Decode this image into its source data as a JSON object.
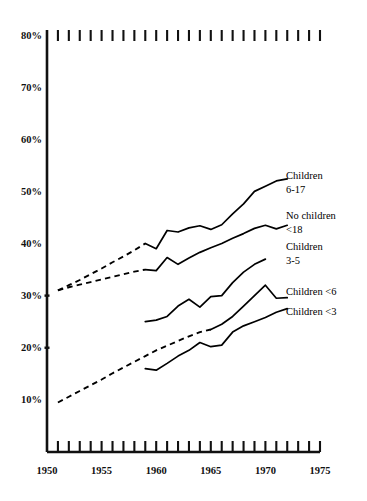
{
  "chart_data": {
    "type": "line",
    "title": "",
    "subtitle": "",
    "xlabel": "",
    "ylabel": "",
    "xlim": [
      1950,
      1975
    ],
    "ylim": [
      0,
      80
    ],
    "x_tick_labels": [
      "1950",
      "1955",
      "1960",
      "1965",
      "1970",
      "1975"
    ],
    "x_tick_values": [
      1950,
      1955,
      1960,
      1965,
      1970,
      1975
    ],
    "x_minor_tick_interval": 1,
    "y_tick_labels": [
      "10%",
      "20%",
      "30%",
      "40%",
      "50%",
      "60%",
      "70%",
      "80%"
    ],
    "y_tick_values": [
      10,
      20,
      30,
      40,
      50,
      60,
      70,
      80
    ],
    "grid": false,
    "legend_position": "right-inline",
    "axis_top_ticks": true,
    "axis_bottom_ticks": true,
    "series": [
      {
        "name": "Children 6-17",
        "label": "Children",
        "label_line2": "6-17",
        "style": "solid-with-dashed-lead",
        "dashed_segment": {
          "x": [
            1951,
            1952,
            1953,
            1954,
            1955,
            1956,
            1957,
            1958,
            1959
          ],
          "values": [
            31.0,
            32.0,
            33.0,
            34.1,
            35.2,
            36.4,
            37.5,
            38.7,
            40.0
          ]
        },
        "x": [
          1959,
          1960,
          1961,
          1962,
          1963,
          1964,
          1965,
          1966,
          1967,
          1968,
          1969,
          1970,
          1971,
          1972
        ],
        "values": [
          40.0,
          39.0,
          42.5,
          42.2,
          43.0,
          43.4,
          42.7,
          43.6,
          45.7,
          47.6,
          50.0,
          51.0,
          52.0,
          52.4
        ]
      },
      {
        "name": "No children <18",
        "label": "No children",
        "label_line2": "<18",
        "style": "solid-with-dashed-lead",
        "dashed_segment": {
          "x": [
            1951,
            1952,
            1953,
            1954,
            1955,
            1956,
            1957,
            1958,
            1959
          ],
          "values": [
            31.0,
            31.6,
            32.1,
            32.6,
            33.1,
            33.6,
            34.1,
            34.6,
            35.0
          ]
        },
        "x": [
          1959,
          1960,
          1961,
          1962,
          1963,
          1964,
          1965,
          1966,
          1967,
          1968,
          1969,
          1970,
          1971,
          1972
        ],
        "values": [
          35.0,
          34.8,
          37.3,
          36.0,
          37.2,
          38.3,
          39.2,
          40.0,
          41.0,
          41.9,
          42.9,
          43.5,
          42.8,
          43.5
        ]
      },
      {
        "name": "Children 3-5",
        "label": "Children",
        "label_line2": "3-5",
        "style": "solid",
        "x": [
          1959,
          1960,
          1961,
          1962,
          1963,
          1964,
          1965,
          1966,
          1967,
          1968,
          1969,
          1970
        ],
        "values": [
          25.0,
          25.3,
          26.0,
          28.0,
          29.3,
          27.8,
          29.8,
          30.0,
          32.5,
          34.5,
          36.0,
          37.0
        ]
      },
      {
        "name": "Children <6",
        "label": "Children <6",
        "label_line2": "",
        "style": "solid-with-dashed-lead",
        "dashed_segment": {
          "x": [
            1951,
            1952,
            1953,
            1954,
            1955,
            1956,
            1957,
            1958,
            1959,
            1960,
            1961,
            1962,
            1963,
            1964,
            1965
          ],
          "values": [
            9.5,
            10.6,
            11.7,
            12.8,
            13.9,
            15.1,
            16.2,
            17.3,
            18.4,
            19.5,
            20.4,
            21.3,
            22.2,
            23.0,
            23.5
          ]
        },
        "x": [
          1965,
          1966,
          1967,
          1968,
          1969,
          1970,
          1971,
          1972
        ],
        "values": [
          23.5,
          24.5,
          26.0,
          28.0,
          30.0,
          32.0,
          29.5,
          29.6
        ]
      },
      {
        "name": "Children <3",
        "label": "Children <3",
        "label_line2": "",
        "style": "solid",
        "x": [
          1959,
          1960,
          1961,
          1962,
          1963,
          1964,
          1965,
          1966,
          1967,
          1968,
          1969,
          1970,
          1971,
          1972
        ],
        "values": [
          16.0,
          15.7,
          17.0,
          18.4,
          19.5,
          21.0,
          20.2,
          20.5,
          23.0,
          24.2,
          25.0,
          25.8,
          26.8,
          27.5
        ]
      }
    ],
    "annotations": [
      {
        "text": "Children",
        "text2": "6-17"
      },
      {
        "text": "No children",
        "text2": "<18"
      },
      {
        "text": "Children",
        "text2": "3-5"
      },
      {
        "text": "Children <6",
        "text2": ""
      },
      {
        "text": "Children <3",
        "text2": ""
      }
    ],
    "colors": {
      "line": "#000000",
      "axis": "#111111",
      "background": "#ffffff"
    }
  }
}
